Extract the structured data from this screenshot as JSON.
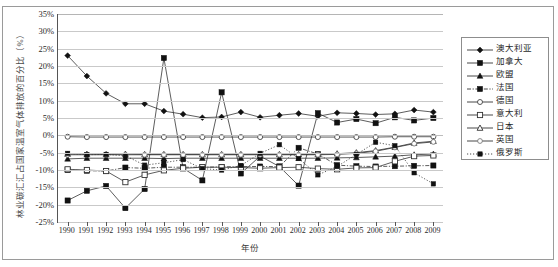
{
  "chart_data": {
    "type": "line",
    "title": "",
    "xlabel": "年份",
    "ylabel": "林业碳汇汇占国家温室气体排放的百分比（%）",
    "ylim": [
      -25,
      35
    ],
    "ytick_labels": [
      "35%",
      "30%",
      "25%",
      "20%",
      "15%",
      "10%",
      "5%",
      "0%",
      "-5%",
      "-10%",
      "-15%",
      "-20%",
      "-25%"
    ],
    "ytick_values": [
      35,
      30,
      25,
      20,
      15,
      10,
      5,
      0,
      -5,
      -10,
      -15,
      -20,
      -25
    ],
    "grid": true,
    "legend_position": "right",
    "categories": [
      "1990",
      "1991",
      "1992",
      "1993",
      "1994",
      "1995",
      "1996",
      "1997",
      "1998",
      "1999",
      "2000",
      "2001",
      "2002",
      "2003",
      "2004",
      "2005",
      "2006",
      "2007",
      "2008",
      "2009"
    ],
    "series": [
      {
        "name": "澳大利亚",
        "marker": "filled-diamond",
        "dash": "solid",
        "values": [
          23.0,
          17.1,
          12.1,
          9.1,
          9.1,
          7.0,
          6.1,
          5.1,
          5.3,
          6.7,
          5.2,
          5.8,
          6.3,
          5.5,
          6.5,
          6.3,
          6.0,
          6.2,
          7.3,
          6.7
        ]
      },
      {
        "name": "加拿大",
        "marker": "filled-square",
        "dash": "solid",
        "values": [
          -18.8,
          -16.0,
          -14.6,
          -21.0,
          -15.5,
          22.3,
          -9.5,
          -13.0,
          12.4,
          -11.0,
          -6.0,
          -9.0,
          -14.5,
          6.4,
          3.7,
          4.7,
          3.5,
          5.2,
          4.3,
          5.0
        ]
      },
      {
        "name": "欧盟",
        "marker": "filled-triangle",
        "dash": "solid",
        "values": [
          -6.8,
          -6.6,
          -6.6,
          -6.6,
          -6.6,
          -6.7,
          -6.6,
          -6.6,
          -6.6,
          -6.6,
          -6.6,
          -6.6,
          -6.6,
          -6.6,
          -6.5,
          -6.4,
          -6.2,
          -6.0,
          -5.6,
          -5.4
        ]
      },
      {
        "name": "法国",
        "marker": "filled-square",
        "dash": "dashdot",
        "values": [
          -10.0,
          -10.2,
          -10.3,
          -9.3,
          -9.5,
          -9.2,
          -9.2,
          -9.2,
          -9.1,
          -9.0,
          -9.0,
          -9.0,
          -3.6,
          -5.4,
          -8.6,
          -8.9,
          -9.0,
          -8.9,
          -8.8,
          -8.7
        ]
      },
      {
        "name": "德国",
        "marker": "open-circle",
        "dash": "solid",
        "values": [
          -0.4,
          -0.5,
          -0.5,
          -0.5,
          -0.5,
          -0.5,
          -0.5,
          -0.5,
          -0.5,
          -0.5,
          -0.5,
          -0.5,
          -0.5,
          -0.5,
          -0.5,
          -0.5,
          -0.5,
          -0.4,
          -0.4,
          -0.4
        ]
      },
      {
        "name": "意大利",
        "marker": "open-square",
        "dash": "solid",
        "values": [
          -9.8,
          -10.0,
          -10.3,
          -13.5,
          -11.4,
          -10.1,
          -9.5,
          -9.2,
          -9.2,
          -9.3,
          -9.5,
          -9.3,
          -9.2,
          -9.6,
          -9.8,
          -9.4,
          -9.3,
          -7.5,
          -6.0,
          -5.8
        ]
      },
      {
        "name": "日本",
        "marker": "open-triangle",
        "dash": "solid",
        "values": [
          -5.4,
          -5.4,
          -5.5,
          -5.4,
          -5.5,
          -5.5,
          -5.5,
          -5.5,
          -5.5,
          -5.5,
          -5.5,
          -5.5,
          -5.5,
          -5.5,
          -5.3,
          -5.0,
          -4.4,
          -3.4,
          -2.2,
          -1.7
        ]
      },
      {
        "name": "英国",
        "marker": "open-circle-light",
        "dash": "solid",
        "values": [
          -5.6,
          -5.6,
          -5.6,
          -5.6,
          -5.6,
          -5.6,
          -5.6,
          -5.6,
          -5.6,
          -5.6,
          -5.6,
          -5.6,
          -5.6,
          -5.6,
          -5.5,
          -5.2,
          -4.6,
          -3.5,
          -2.4,
          -1.9
        ]
      },
      {
        "name": "俄罗斯",
        "marker": "filled-square-small",
        "dash": "dotted",
        "values": [
          -5.2,
          -5.6,
          -5.5,
          -5.9,
          -8.6,
          -7.9,
          -7.0,
          -9.6,
          -10.0,
          -8.7,
          -5.2,
          -2.7,
          -6.7,
          -11.4,
          -9.0,
          -5.5,
          -2.0,
          -3.0,
          -10.8,
          -14.0
        ]
      }
    ]
  },
  "legend": {
    "items": [
      {
        "label": "澳大利亚"
      },
      {
        "label": "加拿大"
      },
      {
        "label": "欧盟"
      },
      {
        "label": "法国"
      },
      {
        "label": "德国"
      },
      {
        "label": "意大利"
      },
      {
        "label": "日本"
      },
      {
        "label": "英国"
      },
      {
        "label": "俄罗斯"
      }
    ]
  },
  "colors": {
    "ink": "#1a1a1a",
    "grid": "#c9c9c9",
    "axis": "#555555",
    "frame": "#9a9a9a"
  }
}
